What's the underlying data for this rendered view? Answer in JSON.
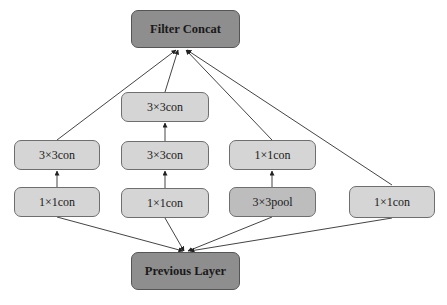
{
  "diagram": {
    "colors": {
      "io_fill": "#8e8e8e",
      "node_fill": "#d5d5d5",
      "pool_fill": "#bdbdbd",
      "edge": "#444444"
    },
    "nodes": {
      "filter_concat": {
        "label": "Filter Concat"
      },
      "previous_layer": {
        "label": "Previous Layer"
      },
      "b1_conv3": {
        "label": "3×3con"
      },
      "b1_conv1": {
        "label": "1×1con"
      },
      "b2_conv3_top": {
        "label": "3×3con"
      },
      "b2_conv3": {
        "label": "3×3con"
      },
      "b2_conv1": {
        "label": "1×1con"
      },
      "b3_conv1": {
        "label": "1×1con"
      },
      "b3_pool": {
        "label": "3×3pool"
      },
      "b4_conv1": {
        "label": "1×1con"
      }
    },
    "edges": [
      {
        "from": "previous_layer",
        "to": "b1_conv1"
      },
      {
        "from": "previous_layer",
        "to": "b2_conv1"
      },
      {
        "from": "previous_layer",
        "to": "b3_pool"
      },
      {
        "from": "previous_layer",
        "to": "b4_conv1"
      },
      {
        "from": "b1_conv1",
        "to": "b1_conv3"
      },
      {
        "from": "b2_conv1",
        "to": "b2_conv3"
      },
      {
        "from": "b2_conv3",
        "to": "b2_conv3_top"
      },
      {
        "from": "b3_pool",
        "to": "b3_conv1"
      },
      {
        "from": "b1_conv3",
        "to": "filter_concat"
      },
      {
        "from": "b2_conv3_top",
        "to": "filter_concat"
      },
      {
        "from": "b3_conv1",
        "to": "filter_concat"
      },
      {
        "from": "b4_conv1",
        "to": "filter_concat"
      }
    ]
  }
}
